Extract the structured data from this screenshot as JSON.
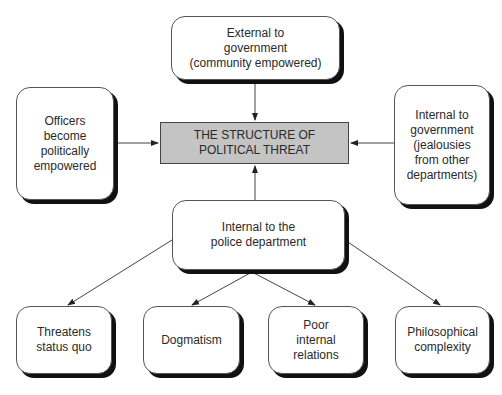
{
  "diagram": {
    "center": {
      "label": "THE STRUCTURE OF\nPOLITICAL THREAT",
      "fill": "#c4c4c4"
    },
    "nodes": {
      "top": {
        "label": "External to\ngovernment\n(community empowered)"
      },
      "left": {
        "label": "Officers\nbecome\npolitically\nempowered"
      },
      "right": {
        "label": "Internal to\ngovernment\n(jealousies\nfrom other\ndepartments)"
      },
      "bottom": {
        "label": "Internal to the\npolice department"
      },
      "child1": {
        "label": "Threatens\nstatus quo"
      },
      "child2": {
        "label": "Dogmatism"
      },
      "child3": {
        "label": "Poor\ninternal\nrelations"
      },
      "child4": {
        "label": "Philosophical\ncomplexity"
      }
    },
    "edges": [
      {
        "from": "top",
        "to": "center"
      },
      {
        "from": "left",
        "to": "center"
      },
      {
        "from": "right",
        "to": "center"
      },
      {
        "from": "bottom",
        "to": "center"
      },
      {
        "from": "bottom",
        "to": "child1"
      },
      {
        "from": "bottom",
        "to": "child2"
      },
      {
        "from": "bottom",
        "to": "child3"
      },
      {
        "from": "bottom",
        "to": "child4"
      }
    ]
  }
}
